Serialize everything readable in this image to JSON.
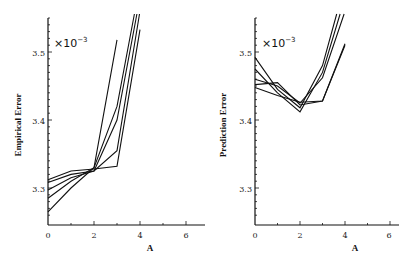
{
  "chart_data": [
    {
      "type": "line",
      "title": "",
      "xlabel": "A",
      "ylabel": "Empirical Error",
      "y_multiplier": "×10^-3",
      "xlim": [
        0,
        6.8
      ],
      "ylim": [
        3.25,
        3.55
      ],
      "xticks": [
        "0",
        "2",
        "4",
        "6"
      ],
      "yticks": [
        "3.3",
        "3.4",
        "3.5"
      ],
      "grid": false,
      "legend": null,
      "x": [
        0,
        1,
        2,
        3,
        4
      ],
      "series": [
        {
          "name": "run1",
          "values": [
            3.265,
            3.3,
            3.33,
            3.518,
            null
          ]
        },
        {
          "name": "run2",
          "values": [
            3.285,
            3.31,
            3.33,
            3.42,
            3.6
          ]
        },
        {
          "name": "run3",
          "values": [
            3.297,
            3.315,
            3.325,
            3.4,
            3.58
          ]
        },
        {
          "name": "run4",
          "values": [
            3.308,
            3.32,
            3.325,
            3.355,
            3.56
          ]
        },
        {
          "name": "run5",
          "values": [
            3.312,
            3.325,
            3.328,
            3.332,
            3.533
          ]
        }
      ]
    },
    {
      "type": "line",
      "title": "",
      "xlabel": "A",
      "ylabel": "Prediction Error",
      "y_multiplier": "×10^-3",
      "xlim": [
        0,
        6.5
      ],
      "ylim": [
        3.25,
        3.55
      ],
      "xticks": [
        "0",
        "2",
        "4",
        "6"
      ],
      "yticks": [
        "3.3",
        "3.4",
        "3.5"
      ],
      "grid": false,
      "legend": null,
      "x": [
        0,
        1,
        2,
        3,
        4
      ],
      "series": [
        {
          "name": "run1",
          "values": [
            3.492,
            3.445,
            3.418,
            3.48,
            3.6
          ]
        },
        {
          "name": "run2",
          "values": [
            3.475,
            3.44,
            3.412,
            3.47,
            3.58
          ]
        },
        {
          "name": "run3",
          "values": [
            3.46,
            3.45,
            3.425,
            3.462,
            3.56
          ]
        },
        {
          "name": "run4",
          "values": [
            3.452,
            3.455,
            3.422,
            3.428,
            3.512
          ]
        },
        {
          "name": "run5",
          "values": [
            3.448,
            3.436,
            3.426,
            3.428,
            3.51
          ]
        }
      ]
    }
  ],
  "left": {
    "ylabel": "Empirical Error",
    "xlabel": "A",
    "mult": "×10",
    "exp": "−3",
    "yt": [
      "3.5",
      "3.4",
      "3.3"
    ],
    "xt": [
      "0",
      "2",
      "4",
      "6"
    ]
  },
  "right": {
    "ylabel": "Prediction Error",
    "xlabel": "A",
    "mult": "×10",
    "exp": "−3",
    "yt": [
      "3.5",
      "3.4",
      "3.3"
    ],
    "xt": [
      "0",
      "2",
      "4",
      "6"
    ]
  }
}
